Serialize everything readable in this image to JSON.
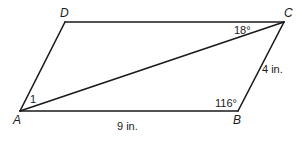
{
  "figure": {
    "type": "parallelogram",
    "vertices": {
      "A": {
        "label": "A",
        "x": 20,
        "y": 111
      },
      "B": {
        "label": "B",
        "x": 238,
        "y": 111
      },
      "C": {
        "label": "C",
        "x": 284,
        "y": 22
      },
      "D": {
        "label": "D",
        "x": 65,
        "y": 22
      }
    },
    "diagonal": "AC",
    "measurements": {
      "side_AB": "9 in.",
      "side_BC": "4 in.",
      "angle_B": "116°",
      "angle_DCA": "18°",
      "angle_1_label": "1"
    },
    "colors": {
      "stroke": "#1a1a1a",
      "background": "#ffffff"
    }
  }
}
